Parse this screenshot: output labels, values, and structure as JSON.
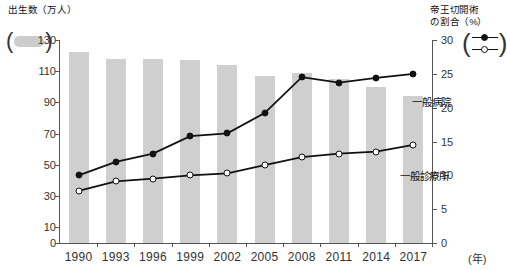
{
  "chart_data": {
    "type": "bar+line",
    "title": "",
    "categories": [
      "1990",
      "1993",
      "1996",
      "1999",
      "2002",
      "2005",
      "2008",
      "2011",
      "2014",
      "2017"
    ],
    "xlabel": "(年)",
    "left_axis": {
      "label": "出生数（万人）",
      "unit": "万人",
      "ticks": [
        0,
        10,
        30,
        50,
        70,
        90,
        110,
        130
      ],
      "min": 0,
      "max": 130
    },
    "right_axis": {
      "label": "帝王切開術\nの割合（%）",
      "unit": "%",
      "ticks": [
        0,
        5,
        10,
        15,
        20,
        25,
        30
      ],
      "min": 0,
      "max": 30
    },
    "bars": {
      "name": "出生数",
      "axis": "left",
      "color": "#cfcfcf",
      "values": [
        122,
        118,
        118,
        117,
        114,
        107,
        109,
        105,
        100,
        94
      ]
    },
    "series": [
      {
        "name": "一般病院",
        "axis": "right",
        "marker": "filled-circle",
        "color": "#111111",
        "values": [
          10.0,
          12.0,
          13.2,
          15.8,
          16.2,
          19.2,
          24.5,
          23.7,
          24.4,
          25.0
        ]
      },
      {
        "name": "一般診療所",
        "axis": "right",
        "marker": "open-circle",
        "color": "#111111",
        "values": [
          7.7,
          9.1,
          9.5,
          10.0,
          10.3,
          11.5,
          12.7,
          13.2,
          13.5,
          14.5
        ]
      }
    ],
    "grid": false,
    "legend_position": "inline-axis-titles"
  },
  "legend": {
    "bar_swatch_name": "出生数",
    "line_keys": [
      "一般病院",
      "一般診療所"
    ],
    "open_paren": "(",
    "close_paren": ")"
  },
  "series_labels": {
    "hospital": "一般病院",
    "clinic": "一般診療所"
  },
  "axis_titles": {
    "left": "出生数（万人）",
    "right": "帝王切開術\nの割合（%）"
  }
}
